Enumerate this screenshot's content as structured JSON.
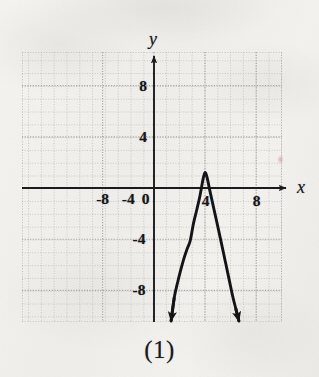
{
  "figure": {
    "caption": "(1)",
    "axis_labels": {
      "x": "x",
      "y": "y"
    },
    "x_ticks": [
      {
        "value": -8,
        "label": "-8"
      },
      {
        "value": -4,
        "label": "-4"
      },
      {
        "value": 0,
        "label": "0"
      },
      {
        "value": 4,
        "label": "4"
      },
      {
        "value": 8,
        "label": "8"
      }
    ],
    "y_ticks": [
      {
        "value": 8,
        "label": "8"
      },
      {
        "value": 4,
        "label": "4"
      },
      {
        "value": -4,
        "label": "-4"
      },
      {
        "value": -8,
        "label": "-8"
      }
    ],
    "colors": {
      "ink": "#16161a",
      "curve": "#141418",
      "grid": "#b9b8b4",
      "paper": "#f2f1ee"
    }
  },
  "chart_data": {
    "type": "line",
    "title": "",
    "subtitle": "",
    "xlabel": "x",
    "ylabel": "y",
    "xlim": [
      -10.3,
      10.0
    ],
    "ylim": [
      -10.6,
      10.6
    ],
    "grid": true,
    "grid_spacing": 1,
    "major_tick_spacing": 4,
    "legend": null,
    "annotations": [
      "(1)"
    ],
    "curve": {
      "name": "downward parabola",
      "shape": "parabola",
      "opens": "down",
      "vertex": [
        4,
        1.2
      ],
      "roots": [
        2.3,
        5.7
      ],
      "axis_of_symmetry": 4,
      "equation_estimate": "y = -1 * (x - 4)^2 + 1.2",
      "arrowheads": [
        "both ends, pointing down"
      ],
      "endpoints": [
        [
          1.35,
          -10.4
        ],
        [
          6.65,
          -10.4
        ]
      ],
      "points": [
        [
          1.35,
          -10.4
        ],
        [
          1.6,
          -8.56
        ],
        [
          1.85,
          -7.42
        ],
        [
          2.1,
          -6.42
        ],
        [
          2.35,
          -5.52
        ],
        [
          2.6,
          -4.76
        ],
        [
          2.85,
          -4.1
        ],
        [
          3.1,
          -2.76
        ],
        [
          3.35,
          -1.74
        ],
        [
          3.6,
          -0.64
        ],
        [
          3.85,
          0.7
        ],
        [
          4.0,
          1.2
        ],
        [
          4.15,
          0.86
        ],
        [
          4.4,
          -0.3
        ],
        [
          4.65,
          -1.44
        ],
        [
          4.9,
          -2.56
        ],
        [
          5.15,
          -3.7
        ],
        [
          5.4,
          -4.86
        ],
        [
          5.65,
          -6.04
        ],
        [
          5.9,
          -7.22
        ],
        [
          6.15,
          -8.4
        ],
        [
          6.4,
          -9.4
        ],
        [
          6.65,
          -10.4
        ]
      ]
    }
  }
}
